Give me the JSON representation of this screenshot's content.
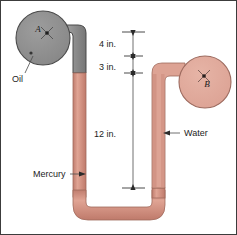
{
  "figure": {
    "background_color": "#ffffff",
    "border_color": "#3c3c3c",
    "vessels": [
      {
        "id": "A",
        "label": "A",
        "fluid_label": "Oil",
        "fill_color": "#8e8e8e",
        "stroke_color": "#4a4a4a",
        "center_x": 43,
        "center_y": 38,
        "radius": 27
      },
      {
        "id": "B",
        "label": "B",
        "fluid_label": "Water",
        "fill_color": "#e0aa9c",
        "stroke_color": "#9c6a5e",
        "center_x": 205,
        "center_y": 82,
        "radius": 26
      }
    ],
    "fluids": {
      "oil": {
        "name": "Oil",
        "color": "#8e8e8e"
      },
      "water": {
        "name": "Water",
        "color": "#e0aa9c"
      },
      "mercury": {
        "name": "Mercury",
        "color": "#d1897a"
      }
    },
    "callouts": [
      {
        "id": "oil",
        "label": "Oil",
        "text_x": 12,
        "text_y": 80,
        "anchor": "start"
      },
      {
        "id": "water",
        "label": "Water",
        "text_x": 183,
        "text_y": 136,
        "anchor": "start"
      },
      {
        "id": "mercury",
        "label": "Mercury",
        "text_x": 33,
        "text_y": 177,
        "anchor": "start"
      }
    ],
    "dimensions": [
      {
        "id": "dim-4in",
        "label": "4 in.",
        "value": 4,
        "unit": "in.",
        "y_top": 32,
        "y_bottom": 56,
        "text_x": 116,
        "text_y": 47
      },
      {
        "id": "dim-3in",
        "label": "3 in.",
        "value": 3,
        "unit": "in.",
        "y_top": 56,
        "y_bottom": 73,
        "text_x": 116,
        "text_y": 68
      },
      {
        "id": "dim-12in",
        "label": "12 in.",
        "value": 12,
        "unit": "in.",
        "y_top": 73,
        "y_bottom": 188,
        "text_x": 113,
        "text_y": 137
      }
    ],
    "dimension_line_x": 133
  }
}
